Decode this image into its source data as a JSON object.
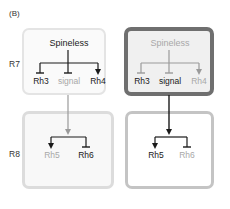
{
  "panel_label": "(B)",
  "rows": [
    {
      "label": "R7"
    },
    {
      "label": "R8"
    }
  ],
  "boxes": {
    "top_left": {
      "regulator": "Spineless",
      "targets": [
        {
          "label": "Rh3",
          "edge": "inhibit",
          "state": "on"
        },
        {
          "label": "signal",
          "edge": "inhibit",
          "state": "off"
        },
        {
          "label": "Rh4",
          "edge": "activate",
          "state": "on"
        }
      ]
    },
    "top_right": {
      "regulator": "Spineless",
      "targets": [
        {
          "label": "Rh3",
          "edge": "inhibit",
          "state": "on"
        },
        {
          "label": "signal",
          "edge": "inhibit",
          "state": "on"
        },
        {
          "label": "Rh4",
          "edge": "activate",
          "state": "off"
        }
      ]
    },
    "bottom_left": {
      "targets": [
        {
          "label": "Rh5",
          "edge": "activate",
          "state": "off"
        },
        {
          "label": "Rh6",
          "edge": "inhibit",
          "state": "on"
        }
      ]
    },
    "bottom_right": {
      "targets": [
        {
          "label": "Rh5",
          "edge": "activate",
          "state": "on"
        },
        {
          "label": "Rh6",
          "edge": "inhibit",
          "state": "off"
        }
      ]
    }
  },
  "colors": {
    "active_text": "#1a1a1a",
    "inactive_text": "#a8a8a8",
    "active_line": "#1a1a1a",
    "inactive_line": "#9a9a9a",
    "dark_border": "#6f6f6f",
    "light_border": "#e4e4e4"
  }
}
